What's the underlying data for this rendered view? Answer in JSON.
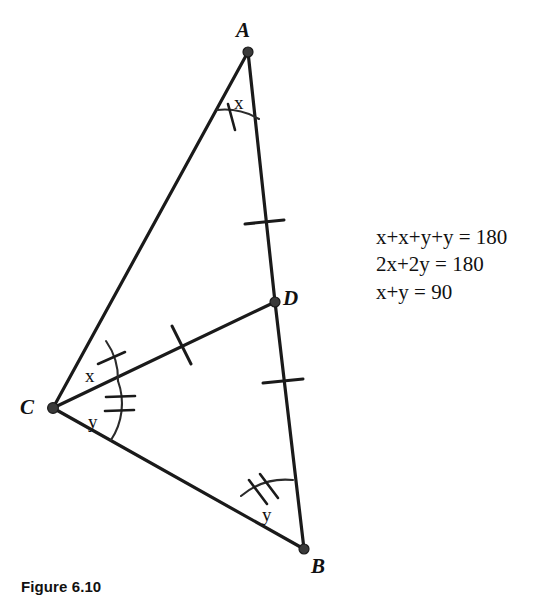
{
  "figure": {
    "caption": "Figure 6.10",
    "vertices": [
      {
        "name": "A",
        "label": "A",
        "x": 248,
        "y": 52,
        "label_x": 236,
        "label_y": 20
      },
      {
        "name": "B",
        "label": "B",
        "x": 304,
        "y": 549,
        "label_x": 311,
        "label_y": 556
      },
      {
        "name": "C",
        "label": "C",
        "x": 53,
        "y": 408,
        "label_x": 20,
        "label_y": 397
      },
      {
        "name": "D",
        "label": "D",
        "x": 275,
        "y": 302,
        "label_x": 283,
        "label_y": 283
      }
    ],
    "segments": [
      {
        "name": "segment-AC",
        "from": "A",
        "to": "C"
      },
      {
        "name": "segment-AD",
        "from": "A",
        "to": "D"
      },
      {
        "name": "segment-DB",
        "from": "D",
        "to": "B"
      },
      {
        "name": "segment-CD",
        "from": "C",
        "to": "D"
      },
      {
        "name": "segment-CB",
        "from": "C",
        "to": "B"
      }
    ],
    "congruence_ticks": [
      {
        "name": "tick-AD",
        "segment": "segment-AD",
        "count": 1
      },
      {
        "name": "tick-DB",
        "segment": "segment-DB",
        "count": 1
      },
      {
        "name": "tick-CD",
        "segment": "segment-CD",
        "count": 1
      }
    ],
    "angles": [
      {
        "name": "angle-A",
        "label": "x",
        "vertex": "A",
        "tick_count": 1,
        "label_x": 234,
        "label_y": 93
      },
      {
        "name": "angle-C-upper",
        "label": "x",
        "vertex": "C",
        "tick_count": 1,
        "label_x": 85,
        "label_y": 366
      },
      {
        "name": "angle-C-lower",
        "label": "y",
        "vertex": "C",
        "tick_count": 2,
        "label_x": 88,
        "label_y": 412
      },
      {
        "name": "angle-B",
        "label": "y",
        "vertex": "B",
        "tick_count": 2,
        "label_x": 262,
        "label_y": 505
      }
    ]
  },
  "equations": {
    "line1": "x+x+y+y = 180",
    "line2": "2x+2y = 180",
    "line3": "x+y = 90"
  },
  "colors": {
    "ink": "#1a1a1a",
    "background": "#ffffff"
  }
}
